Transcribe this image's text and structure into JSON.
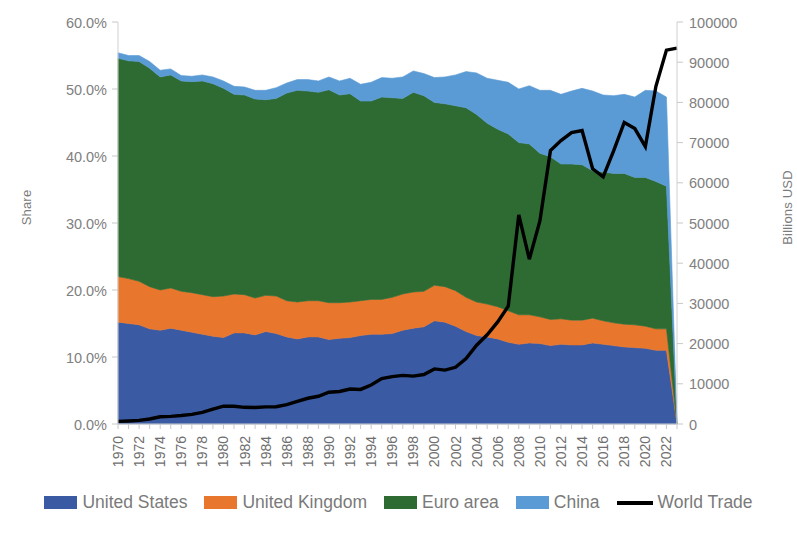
{
  "chart_data": {
    "type": "area",
    "title": "",
    "xlabel": "",
    "ylabel": "Share",
    "y2label": "Billions USD",
    "grid": false,
    "legend_position": "bottom",
    "stacked": true,
    "ylim": [
      0,
      60
    ],
    "y2lim": [
      0,
      100000
    ],
    "y_ticks": [
      "0.0%",
      "10.0%",
      "20.0%",
      "30.0%",
      "40.0%",
      "50.0%",
      "60.0%"
    ],
    "y_tick_values": [
      0,
      10,
      20,
      30,
      40,
      50,
      60
    ],
    "y2_ticks": [
      "0",
      "10000",
      "20000",
      "30000",
      "40000",
      "50000",
      "60000",
      "70000",
      "80000",
      "90000",
      "100000"
    ],
    "y2_tick_values": [
      0,
      10000,
      20000,
      30000,
      40000,
      50000,
      60000,
      70000,
      80000,
      90000,
      100000
    ],
    "x": [
      1970,
      1971,
      1972,
      1973,
      1974,
      1975,
      1976,
      1977,
      1978,
      1979,
      1980,
      1981,
      1982,
      1983,
      1984,
      1985,
      1986,
      1987,
      1988,
      1989,
      1990,
      1991,
      1992,
      1993,
      1994,
      1995,
      1996,
      1997,
      1998,
      1999,
      2000,
      2001,
      2002,
      2003,
      2004,
      2005,
      2006,
      2007,
      2008,
      2009,
      2010,
      2011,
      2012,
      2013,
      2014,
      2015,
      2016,
      2017,
      2018,
      2019,
      2020,
      2021,
      2022,
      2023
    ],
    "x_tick_labels": [
      "1970",
      "1972",
      "1974",
      "1976",
      "1978",
      "1980",
      "1982",
      "1984",
      "1986",
      "1988",
      "1990",
      "1992",
      "1994",
      "1996",
      "1998",
      "2000",
      "2002",
      "2004",
      "2006",
      "2008",
      "2010",
      "2012",
      "2014",
      "2016",
      "2018",
      "2020",
      "2022"
    ],
    "series": [
      {
        "name": "United States",
        "color": "#3a5ba3",
        "axis": "left",
        "values": [
          15.2,
          15.0,
          14.8,
          14.2,
          14.0,
          14.3,
          14.0,
          13.7,
          13.4,
          13.1,
          12.9,
          13.6,
          13.6,
          13.3,
          13.8,
          13.5,
          13.0,
          12.7,
          13.0,
          13.0,
          12.6,
          12.8,
          12.9,
          13.2,
          13.4,
          13.4,
          13.5,
          14.0,
          14.3,
          14.5,
          15.4,
          15.2,
          14.6,
          13.8,
          13.2,
          13.0,
          12.7,
          12.2,
          11.9,
          12.1,
          12.0,
          11.7,
          11.9,
          11.8,
          11.8,
          12.1,
          11.9,
          11.7,
          11.5,
          11.4,
          11.3,
          11.0,
          11.0,
          0.0
        ]
      },
      {
        "name": "United Kingdom",
        "color": "#e8762d",
        "axis": "left",
        "values": [
          6.8,
          6.7,
          6.5,
          6.3,
          6.0,
          6.0,
          5.8,
          5.9,
          5.9,
          5.9,
          6.2,
          5.8,
          5.7,
          5.5,
          5.4,
          5.6,
          5.4,
          5.5,
          5.4,
          5.4,
          5.5,
          5.3,
          5.3,
          5.2,
          5.2,
          5.2,
          5.4,
          5.4,
          5.4,
          5.3,
          5.3,
          5.3,
          5.3,
          5.1,
          5.0,
          4.9,
          4.8,
          4.7,
          4.4,
          4.2,
          4.0,
          3.9,
          3.8,
          3.7,
          3.7,
          3.7,
          3.5,
          3.4,
          3.4,
          3.4,
          3.3,
          3.2,
          3.2,
          0.0
        ]
      },
      {
        "name": "Euro area",
        "color": "#2d6b33",
        "axis": "left",
        "values": [
          32.6,
          32.5,
          32.8,
          32.6,
          31.8,
          31.8,
          31.4,
          31.5,
          31.9,
          31.8,
          31.0,
          29.8,
          29.8,
          29.7,
          29.2,
          29.5,
          31.0,
          31.6,
          31.3,
          31.1,
          31.8,
          31.0,
          31.1,
          29.8,
          29.6,
          30.2,
          29.8,
          29.2,
          29.8,
          29.2,
          27.3,
          27.3,
          27.6,
          28.3,
          28.0,
          27.0,
          26.5,
          26.4,
          25.7,
          25.5,
          24.4,
          24.3,
          23.1,
          23.3,
          23.2,
          22.0,
          22.2,
          22.3,
          22.5,
          22.0,
          22.2,
          22.0,
          21.3,
          0.0
        ]
      },
      {
        "name": "China",
        "color": "#5b9bd5",
        "axis": "left",
        "values": [
          0.8,
          0.8,
          0.9,
          1.0,
          1.0,
          0.9,
          0.8,
          0.8,
          0.9,
          1.0,
          1.1,
          1.2,
          1.2,
          1.3,
          1.4,
          1.6,
          1.5,
          1.6,
          1.7,
          1.7,
          1.9,
          2.1,
          2.3,
          2.5,
          2.8,
          2.9,
          2.9,
          3.2,
          3.2,
          3.3,
          3.7,
          4.0,
          4.6,
          5.4,
          6.2,
          6.7,
          7.3,
          7.7,
          8.0,
          8.7,
          9.4,
          9.9,
          10.4,
          10.9,
          11.4,
          11.9,
          11.5,
          11.6,
          11.8,
          12.0,
          13.0,
          13.5,
          13.3,
          0.0
        ]
      }
    ],
    "line_series": {
      "name": "World Trade",
      "color": "#000000",
      "axis": "right",
      "unit": "Billions USD",
      "values": [
        650,
        750,
        900,
        1250,
        1800,
        1900,
        2100,
        2400,
        2900,
        3700,
        4450,
        4400,
        4150,
        4100,
        4250,
        4300,
        4800,
        5600,
        6400,
        6900,
        7900,
        8100,
        8700,
        8600,
        9700,
        11300,
        11800,
        12100,
        11900,
        12300,
        13700,
        13400,
        14100,
        16300,
        19600,
        22200,
        25400,
        29300,
        52000,
        41000,
        50500,
        68000,
        70500,
        72500,
        73000,
        63500,
        61500,
        68000,
        75000,
        73500,
        69000,
        84000,
        93000,
        93500
      ]
    }
  },
  "legend": {
    "items": [
      {
        "label": "United States",
        "color": "#3a5ba3",
        "marker": "swatch"
      },
      {
        "label": "United Kingdom",
        "color": "#e8762d",
        "marker": "swatch"
      },
      {
        "label": "Euro area",
        "color": "#2d6b33",
        "marker": "swatch"
      },
      {
        "label": "China",
        "color": "#5b9bd5",
        "marker": "swatch"
      },
      {
        "label": "World Trade",
        "color": "#000000",
        "marker": "line"
      }
    ]
  },
  "axes": {
    "left_title": "Share",
    "right_title": "Billions USD"
  }
}
